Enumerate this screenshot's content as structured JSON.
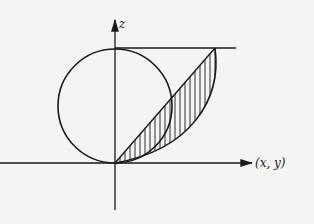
{
  "diagram": {
    "axes": {
      "vertical_label": "z",
      "horizontal_label": "(x, y)"
    },
    "elements": [
      {
        "name": "circle",
        "description": "circle tangent to horizontal axis at origin"
      },
      {
        "name": "horizontal-top-line",
        "description": "horizontal tangent line at top of circle"
      },
      {
        "name": "diagonal-line",
        "description": "straight line from origin to upper-right point"
      },
      {
        "name": "curve",
        "description": "curve from origin to upper-right point"
      },
      {
        "name": "hatched-region",
        "description": "region between diagonal line and curve"
      }
    ],
    "colors": {
      "ink": "#1a1a1a",
      "paper": "#f4f4f2"
    }
  }
}
